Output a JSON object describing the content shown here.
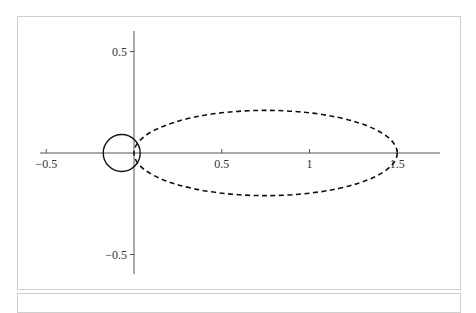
{
  "chart_data": {
    "type": "line",
    "title": "",
    "xlabel": "",
    "ylabel": "",
    "xlim": [
      -0.55,
      1.75
    ],
    "ylim": [
      -0.6,
      0.6
    ],
    "grid": false,
    "legend": null,
    "x_ticks": [
      {
        "value": -0.5,
        "label": "−0.5"
      },
      {
        "value": 0.5,
        "label": "0.5"
      },
      {
        "value": 1,
        "label": "1"
      },
      {
        "value": 1.5,
        "label": "1.5"
      }
    ],
    "y_ticks": [
      {
        "value": 0.5,
        "label": "0.5"
      },
      {
        "value": -0.5,
        "label": "−0.5"
      }
    ],
    "series": [
      {
        "name": "circle",
        "style": "solid",
        "shape": "circle",
        "center": [
          -0.07,
          0
        ],
        "radius": 0.09
      },
      {
        "name": "ellipse",
        "style": "dashed",
        "shape": "ellipse",
        "center": [
          0.75,
          0
        ],
        "semi_axis_x": 0.75,
        "semi_axis_y": 0.21
      }
    ]
  },
  "colors": {
    "axis": "#555555",
    "curve": "#111111",
    "panel_border": "#cfcfcf"
  }
}
